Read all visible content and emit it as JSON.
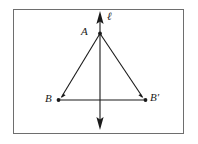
{
  "figure": {
    "type": "geometry-diagram",
    "frame": {
      "border_color": "#6e6e6e",
      "background": "#ffffff"
    },
    "stroke_color": "#1a1a1a",
    "labels": {
      "apex": "A",
      "line": "ℓ",
      "left_vertex": "B",
      "right_vertex": "B′"
    },
    "points": {
      "A": {
        "x": 100,
        "y": 33
      },
      "B": {
        "x": 58,
        "y": 100
      },
      "B_prime": {
        "x": 146,
        "y": 100
      }
    },
    "line_of_reflection": {
      "x": 100,
      "y_top": 12,
      "y_bottom": 129,
      "arrow_top": true,
      "arrow_bottom": true
    },
    "segments": [
      {
        "name": "A-B",
        "from": "A",
        "to": "B",
        "arrow_at_end": true
      },
      {
        "name": "A-B-prime",
        "from": "A",
        "to": "B_prime",
        "arrow_at_end": true
      },
      {
        "name": "B-B-prime",
        "from": "B",
        "to": "B_prime",
        "arrow_at_end": false
      }
    ],
    "vertex_dots": [
      "A",
      "B",
      "B_prime"
    ]
  }
}
